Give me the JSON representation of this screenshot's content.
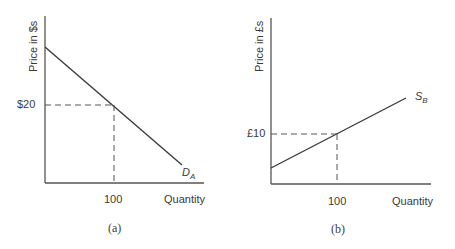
{
  "panels": [
    {
      "id": "a",
      "caption": "(a)",
      "ylabel": "Price in $s",
      "xlabel": "Quantity",
      "price_tick": "$20",
      "quantity_tick": "100",
      "curve_label_main": "D",
      "curve_label_sub": "A",
      "curve_type": "demand"
    },
    {
      "id": "b",
      "caption": "(b)",
      "ylabel": "Price in £s",
      "xlabel": "Quantity",
      "price_tick": "£10",
      "quantity_tick": "100",
      "curve_label_main": "S",
      "curve_label_sub": "B",
      "curve_type": "supply"
    }
  ],
  "colors": {
    "line": "#3a3a3a",
    "dash": "#555555"
  }
}
